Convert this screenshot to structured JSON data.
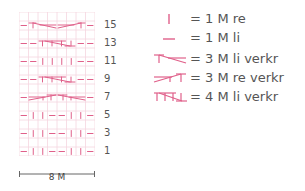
{
  "chart": {
    "columns": 8,
    "rows": 16,
    "colors": {
      "symbol": "#e0608a",
      "grid": "#f5d6df"
    },
    "row_numbers": [
      "15",
      "13",
      "11",
      "9",
      "7",
      "5",
      "3",
      "1"
    ],
    "scale_label": "8 M",
    "pattern_rows": [
      {
        "row": 15,
        "cells": [
          "li",
          "3M-li-verkr",
          "3M-re-verkr",
          "li"
        ]
      },
      {
        "row": 13,
        "cells": [
          "li",
          "li",
          "4M-li-verkr",
          "li",
          "li"
        ]
      },
      {
        "row": 11,
        "cells": [
          "li",
          "li",
          "re",
          "re",
          "re",
          "re",
          "li",
          "li"
        ]
      },
      {
        "row": 9,
        "cells": [
          "li",
          "li",
          "4M-li-verkr",
          "li",
          "li"
        ]
      },
      {
        "row": 7,
        "cells": [
          "li",
          "3M-re-verkr",
          "3M-li-verkr",
          "li"
        ]
      },
      {
        "row": 5,
        "cells": [
          "li",
          "re",
          "re",
          "li",
          "li",
          "re",
          "re",
          "li"
        ]
      },
      {
        "row": 3,
        "cells": [
          "li",
          "re",
          "re",
          "li",
          "li",
          "re",
          "re",
          "li"
        ]
      },
      {
        "row": 1,
        "cells": [
          "li",
          "re",
          "re",
          "li",
          "li",
          "re",
          "re",
          "li"
        ]
      }
    ]
  },
  "legend": [
    {
      "symbol": "re",
      "text": "= 1 M re"
    },
    {
      "symbol": "li",
      "text": "= 1 M li"
    },
    {
      "symbol": "3M-li-verkr",
      "text": "= 3 M li verkr"
    },
    {
      "symbol": "3M-re-verkr",
      "text": "= 3 M re verkr"
    },
    {
      "symbol": "4M-li-verkr",
      "text": "= 4 M li verkr"
    }
  ]
}
